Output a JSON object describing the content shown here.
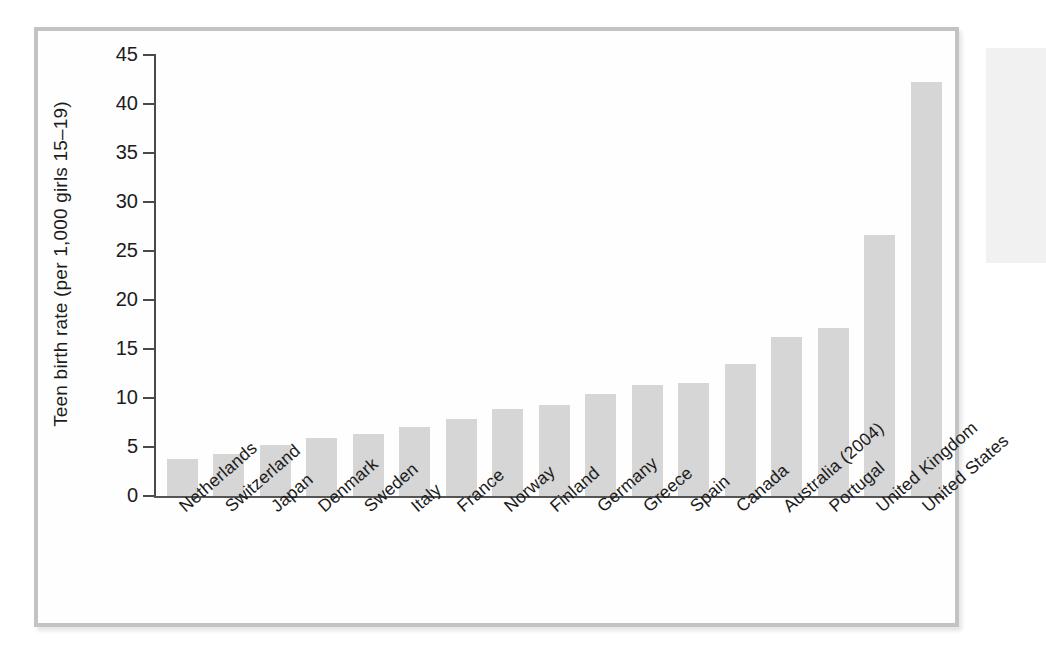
{
  "chart_data": {
    "type": "bar",
    "title": "",
    "subtitle": "",
    "xlabel": "",
    "ylabel": "Teen birth rate (per 1,000 girls 15–19)",
    "ylim": [
      0,
      45
    ],
    "ytick_step": 5,
    "yticks": [
      "0",
      "5",
      "10",
      "15",
      "20",
      "25",
      "30",
      "35",
      "40",
      "45"
    ],
    "grid": false,
    "legend": false,
    "legend_position": "none",
    "bar_color": "#d6d6d6",
    "axis_color": "#4a4a4a",
    "frame_color": "#c3c3c3",
    "categories": [
      "Netherlands",
      "Switzerland",
      "Japan",
      "Denmark",
      "Sweden",
      "Italy",
      "France",
      "Norway",
      "Finland",
      "Germany",
      "Greece",
      "Spain",
      "Canada",
      "Australia (2004)",
      "Portugal",
      "United Kingdom",
      "United States"
    ],
    "values": [
      3.8,
      4.3,
      5.2,
      5.9,
      6.3,
      7.0,
      7.9,
      8.9,
      9.3,
      10.4,
      11.3,
      11.5,
      13.5,
      16.2,
      17.1,
      26.6,
      42.2
    ],
    "series": [
      {
        "name": "Teen birth rate",
        "values": [
          3.8,
          4.3,
          5.2,
          5.9,
          6.3,
          7.0,
          7.9,
          8.9,
          9.3,
          10.4,
          11.3,
          11.5,
          13.5,
          16.2,
          17.1,
          26.6,
          42.2
        ]
      }
    ]
  }
}
